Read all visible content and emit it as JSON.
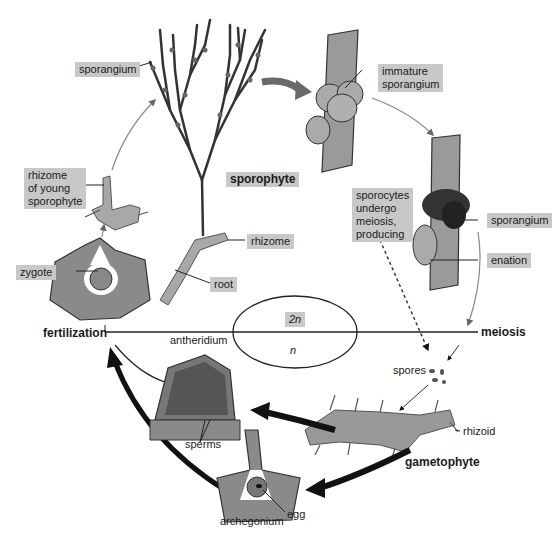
{
  "diagram": {
    "labels": {
      "sporangium_top": "sporangium",
      "immature_sporangium": "immature\nsporangium",
      "sporophyte": "sporophyte",
      "rhizome_young": "rhizome\nof young\nsporophyte",
      "rhizome": "rhizome",
      "root": "root",
      "sporocytes": "sporocytes\nundergo\nmeiosis,\nproducing",
      "sporangium_right": "sporangium",
      "enation": "enation",
      "zygote": "zygote",
      "fertilization": "fertilization",
      "ploidy_2n": "2n",
      "ploidy_n": "n",
      "meiosis": "meiosis",
      "antheridium": "antheridium",
      "spores": "spores",
      "rhizoid": "rhizoid",
      "sperms": "sperms",
      "gametophyte": "gametophyte",
      "egg": "egg",
      "archegonium": "archegonium"
    },
    "colors": {
      "label_box": "#c8c8c8",
      "tissue": "#8a8a8a",
      "tissue_light": "#a8a8a8",
      "line": "#222222",
      "arrow_gray": "#7a7a7a"
    }
  }
}
